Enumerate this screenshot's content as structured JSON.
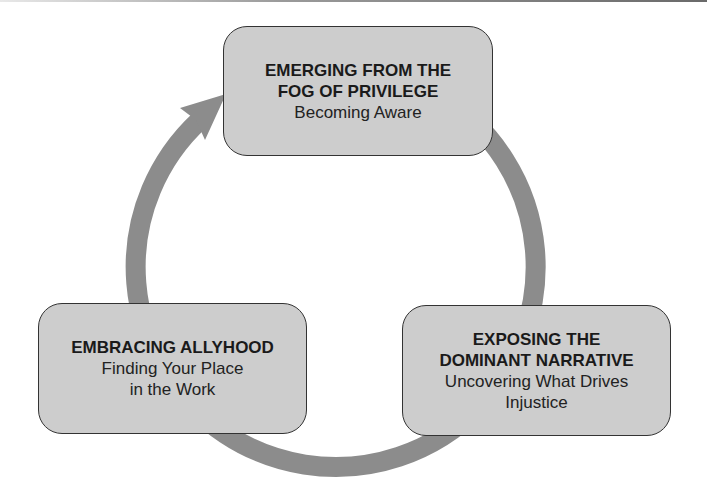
{
  "diagram": {
    "type": "cycle",
    "direction": "clockwise",
    "colors": {
      "box_fill": "#cdcdcd",
      "box_border": "#333333",
      "arrow": "#8c8c8c",
      "text": "#1a1a1a"
    },
    "stages": [
      {
        "id": "top",
        "title_lines": [
          "EMERGING FROM THE",
          "FOG OF PRIVILEGE"
        ],
        "subtitle_lines": [
          "Becoming Aware"
        ]
      },
      {
        "id": "right",
        "title_lines": [
          "EXPOSING THE",
          "DOMINANT NARRATIVE"
        ],
        "subtitle_lines": [
          "Uncovering What Drives",
          "Injustice"
        ]
      },
      {
        "id": "left",
        "title_lines": [
          "EMBRACING ALLYHOOD"
        ],
        "subtitle_lines": [
          "Finding Your Place",
          "in the Work"
        ]
      }
    ]
  }
}
